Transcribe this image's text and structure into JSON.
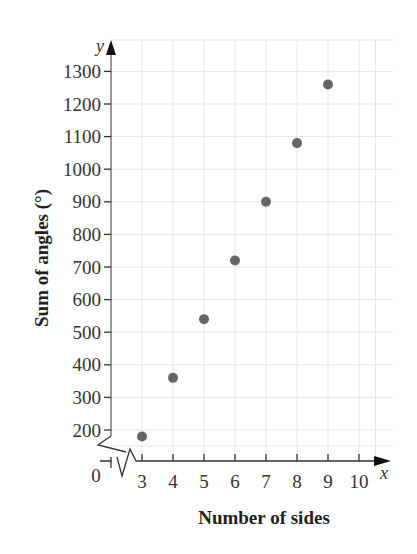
{
  "chart_data": {
    "type": "scatter",
    "title": "",
    "xlabel": "Number of sides",
    "ylabel": "Sum of angles (°)",
    "x_axis_var": "x",
    "y_axis_var": "y",
    "origin_label": "0",
    "x": [
      3,
      4,
      5,
      6,
      7,
      8,
      9
    ],
    "y": [
      180,
      360,
      540,
      720,
      900,
      1080,
      1260
    ],
    "x_ticks": [
      "3",
      "4",
      "5",
      "6",
      "7",
      "8",
      "9",
      "10"
    ],
    "y_ticks": [
      "200",
      "300",
      "400",
      "500",
      "600",
      "700",
      "800",
      "900",
      "1000",
      "1100",
      "1200",
      "1300"
    ],
    "xlim": [
      0,
      10.5
    ],
    "ylim": [
      0,
      1350
    ],
    "axis_breaks": [
      "x",
      "y"
    ],
    "grid": true,
    "legend": null,
    "colors": {
      "point": "#666666",
      "grid": "#e6e6e6",
      "axis": "#333333"
    }
  }
}
